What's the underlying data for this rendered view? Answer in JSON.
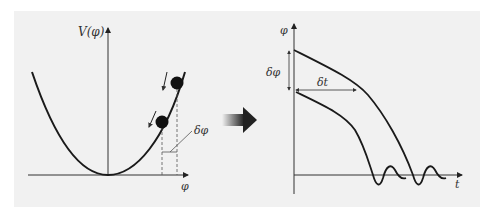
{
  "figure": {
    "left_panel": {
      "y_axis_label": "V(φ)",
      "x_axis_label": "φ",
      "delta_label": "δφ",
      "curve": "parabola potential",
      "balls": 2
    },
    "transition_arrow": "right-arrow",
    "right_panel": {
      "y_axis_label": "φ",
      "x_axis_label": "t",
      "delta_phi_label": "δφ",
      "delta_t_label": "δt",
      "curves": 2
    }
  },
  "colors": {
    "background": "#f1f1f1",
    "ink": "#222222",
    "arrow_dark": "#2a2a2a"
  }
}
